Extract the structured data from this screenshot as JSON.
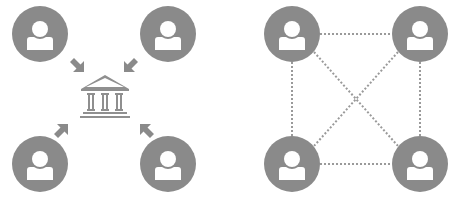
{
  "colors": {
    "node": "#8a8a8a",
    "icon": "#ffffff",
    "arrow": "#8a8a8a",
    "bank": "#8f8f8f",
    "link": "#9a9a9a",
    "background": "#ffffff"
  },
  "centralized": {
    "label": "centralized-network",
    "hub_icon": "bank-icon",
    "nodes": [
      {
        "id": "user-top-left",
        "icon": "user-icon",
        "cx": 40,
        "cy": 34
      },
      {
        "id": "user-top-right",
        "icon": "user-icon",
        "cx": 168,
        "cy": 34
      },
      {
        "id": "user-bottom-left",
        "icon": "user-icon",
        "cx": 40,
        "cy": 164
      },
      {
        "id": "user-bottom-right",
        "icon": "user-icon",
        "cx": 168,
        "cy": 164
      }
    ],
    "arrows": [
      "arrow-icon",
      "arrow-icon",
      "arrow-icon",
      "arrow-icon"
    ]
  },
  "decentralized": {
    "label": "peer-to-peer-network",
    "nodes": [
      {
        "id": "peer-top-left",
        "icon": "user-icon",
        "cx": 292,
        "cy": 34
      },
      {
        "id": "peer-top-right",
        "icon": "user-icon",
        "cx": 420,
        "cy": 34
      },
      {
        "id": "peer-bottom-left",
        "icon": "user-icon",
        "cx": 292,
        "cy": 164
      },
      {
        "id": "peer-bottom-right",
        "icon": "user-icon",
        "cx": 420,
        "cy": 164
      }
    ],
    "links": [
      "top",
      "bottom",
      "left",
      "right",
      "diagonal-1",
      "diagonal-2"
    ]
  }
}
